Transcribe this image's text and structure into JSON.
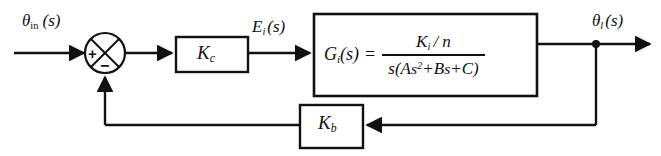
{
  "diagram": {
    "type": "control-system-block-diagram",
    "line_color": "#111111",
    "background_color": "#ffffff",
    "signals": {
      "input": {
        "base": "θ",
        "subscript": "in",
        "argument": "(s)",
        "full": "θin(s)"
      },
      "error_output": {
        "base": "E",
        "subscript": "i",
        "argument": "(s)",
        "full": "Ei(s)"
      },
      "output": {
        "base": "θ",
        "subscript": "l",
        "argument": "(s)",
        "full": "θl(s)"
      }
    },
    "summing_junction": {
      "name": "summing-junction",
      "shape": "circle-with-x",
      "positive_sign": "+",
      "negative_sign": "−",
      "positive_input": "input",
      "negative_input": "feedback"
    },
    "blocks": {
      "controller": {
        "base": "K",
        "subscript": "c",
        "full": "Kc"
      },
      "plant": {
        "lhs_base": "G",
        "lhs_subscript": "i",
        "lhs_argument": "(s)",
        "equals": "=",
        "lhs_full": "Gi(s) =",
        "numerator_base": "K",
        "numerator_subscript": "i",
        "numerator_rest": "/ n",
        "numerator_full": "Ki / n",
        "denominator_full": "s(As2+Bs+C)",
        "denominator_parts": {
          "lead": "s(A",
          "var1": "s",
          "power": "2",
          "plus1": "+B",
          "var2": "s",
          "plus2": "+C",
          "close": ")"
        }
      },
      "feedback": {
        "base": "K",
        "subscript": "b",
        "full": "Kb"
      }
    }
  }
}
